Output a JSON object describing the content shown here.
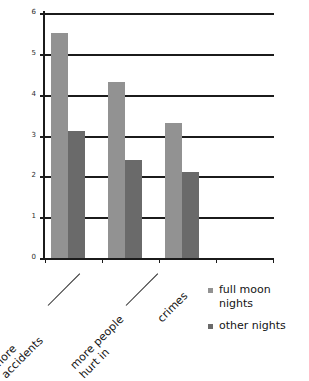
{
  "chart_data": {
    "type": "bar",
    "title": "",
    "subtitle": "",
    "xlabel": "",
    "ylabel": "",
    "ylim": [
      0,
      6
    ],
    "yticks": [
      0,
      1,
      2,
      3,
      4,
      5,
      6
    ],
    "ytick_labels": [
      "0",
      "1",
      "2",
      "3",
      "4",
      "5",
      "6"
    ],
    "grid": true,
    "grid_axis": "y",
    "legend_position": "right",
    "categories": [
      "more accidents",
      "more people hurt in",
      "crimes"
    ],
    "category_lines": [
      [
        "more",
        "accidents"
      ],
      [
        "more people",
        "hurt in"
      ],
      [
        "crimes",
        ""
      ]
    ],
    "series": [
      {
        "name": "full moon nights",
        "color": "#929292",
        "values": [
          5.5,
          4.3,
          3.3
        ]
      },
      {
        "name": "other nights",
        "color": "#6a6a6a",
        "values": [
          3.1,
          2.4,
          2.1
        ]
      }
    ]
  },
  "legend": {
    "items": [
      {
        "label_line1": "full moon",
        "label_line2": "nights",
        "color": "#929292"
      },
      {
        "label_line1": "other nights",
        "label_line2": "",
        "color": "#6a6a6a"
      }
    ]
  }
}
